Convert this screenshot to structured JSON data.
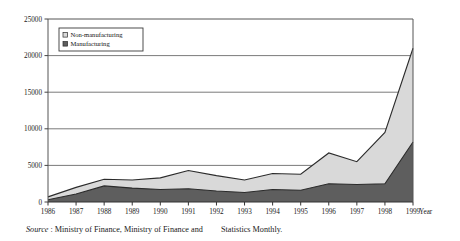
{
  "source": {
    "label": "Source",
    "separator": ":",
    "text_part1": "Ministry of Finance, Ministry of Finance and",
    "text_part2": "Statistics Monthly."
  },
  "legend": {
    "items": [
      {
        "label": "Non-manufacturing",
        "color": "#d9d9d9",
        "swatch": "legend-swatch-non-manufacturing"
      },
      {
        "label": "Manufacturing",
        "color": "#5e5e5e",
        "swatch": "legend-swatch-manufacturing"
      }
    ]
  },
  "axes": {
    "x_axis_title": "Year",
    "y_ticks": [
      "0",
      "5000",
      "10000",
      "15000",
      "20000",
      "25000"
    ],
    "x_ticks": [
      "1986",
      "1987",
      "1988",
      "1989",
      "1990",
      "1991",
      "1992",
      "1993",
      "1994",
      "1995",
      "1996",
      "1997",
      "1998",
      "1999"
    ]
  },
  "chart_data": {
    "type": "area",
    "stacked": true,
    "title": "",
    "xlabel": "Year",
    "ylabel": "",
    "ylim": [
      0,
      25000
    ],
    "ytick_step": 5000,
    "grid": true,
    "legend_position": "top-left-inside",
    "categories": [
      "1986",
      "1987",
      "1988",
      "1989",
      "1990",
      "1991",
      "1992",
      "1993",
      "1994",
      "1995",
      "1996",
      "1997",
      "1998",
      "1999"
    ],
    "series": [
      {
        "name": "Manufacturing",
        "color": "#5e5e5e",
        "values": [
          300,
          1100,
          2200,
          1900,
          1700,
          1800,
          1500,
          1300,
          1700,
          1600,
          2500,
          2400,
          2500,
          8200
        ]
      },
      {
        "name": "Non-manufacturing",
        "color": "#d9d9d9",
        "values": [
          400,
          900,
          900,
          1100,
          1600,
          2500,
          2100,
          1700,
          2200,
          2200,
          4200,
          3100,
          7000,
          12800
        ]
      }
    ],
    "totals": [
      700,
      2000,
      3100,
      3000,
      3300,
      4300,
      3600,
      3000,
      3900,
      3800,
      6700,
      5500,
      9500,
      21000
    ]
  },
  "colors": {
    "axis": "#555555",
    "grid": "#6b6b6b",
    "manufacturing": "#5e5e5e",
    "non_manufacturing": "#d9d9d9",
    "outline": "#2b2b2b",
    "background": "#ffffff"
  }
}
